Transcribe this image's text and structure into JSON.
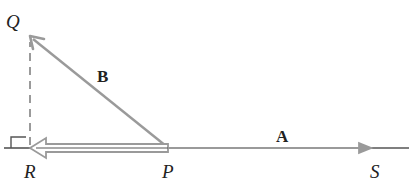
{
  "diagram": {
    "type": "vector-diagram",
    "points": {
      "Q": {
        "label": "Q",
        "x": 30,
        "y": 36
      },
      "R": {
        "label": "R",
        "x": 30,
        "y": 148
      },
      "P": {
        "label": "P",
        "x": 168,
        "y": 148
      },
      "S": {
        "label": "S",
        "x": 372,
        "y": 148
      }
    },
    "vectors": {
      "A": {
        "label": "A",
        "from": "P",
        "to": "S"
      },
      "B": {
        "label": "B",
        "from": "P",
        "to": "Q"
      },
      "projection": {
        "from": "P",
        "to": "R",
        "style": "hollow-double-arrow"
      }
    },
    "dashed_line": {
      "from": "R",
      "to": "Q"
    },
    "right_angle_marker": {
      "at": "R"
    },
    "colors": {
      "vector": "#9a9a9a",
      "baseline": "#555555",
      "text": "#222222"
    }
  }
}
